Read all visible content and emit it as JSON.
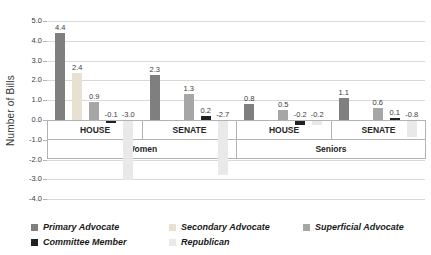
{
  "chart_data": {
    "type": "bar",
    "title": "",
    "ylabel": "Number of Bills",
    "xlabel": "",
    "ylim": [
      -4.0,
      5.0
    ],
    "ytick_step": 1.0,
    "yticks": [
      "5.0",
      "4.0",
      "3.0",
      "2.0",
      "1.0",
      "0.0",
      "-1.0",
      "-2.0",
      "-3.0",
      "-4.0"
    ],
    "grid": "horizontal",
    "legend_position": "bottom",
    "series": [
      {
        "name": "Primary Advocate",
        "color": "#7f7f7f"
      },
      {
        "name": "Secondary Advocate",
        "color": "#e6e1d0"
      },
      {
        "name": "Superficial Advocate",
        "color": "#a6a6a6"
      },
      {
        "name": "Committee Member",
        "color": "#212121"
      },
      {
        "name": "Republican",
        "color": "#e9e9e9"
      }
    ],
    "groups": [
      {
        "category": "Women",
        "chamber": "HOUSE",
        "values": [
          4.4,
          2.4,
          0.9,
          -0.1,
          -3.0
        ]
      },
      {
        "category": "Women",
        "chamber": "SENATE",
        "values": [
          2.3,
          null,
          1.3,
          0.2,
          -2.7
        ]
      },
      {
        "category": "Seniors",
        "chamber": "HOUSE",
        "values": [
          0.8,
          null,
          0.5,
          -0.2,
          -0.2
        ]
      },
      {
        "category": "Seniors",
        "chamber": "SENATE",
        "values": [
          1.1,
          null,
          0.6,
          0.1,
          -0.8
        ]
      }
    ],
    "category_labels": [
      "Women",
      "Seniors"
    ],
    "colors": {
      "gridline": "#d9d9d9",
      "axis_border": "#b3b3b3",
      "tick_text": "#3c3c3c",
      "background": "#ffffff"
    }
  }
}
